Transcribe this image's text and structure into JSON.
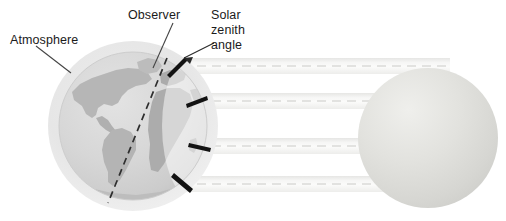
{
  "figure": {
    "kind": "solar-zenith-angle-diagram",
    "width": 506,
    "height": 221,
    "background": "#ffffff"
  },
  "labels": {
    "atmosphere": "Atmosphere",
    "observer": "Observer",
    "solar_zenith_angle_line1": "Solar",
    "solar_zenith_angle_line2": "zenith",
    "solar_zenith_angle_line3": "angle"
  },
  "colors": {
    "text": "#1b1b1b",
    "leader_line": "#3a3a3a",
    "atmosphere_halo": "#e2e2e2",
    "earth_ocean": "#d8d8d8",
    "earth_land": "#b4b4b4",
    "earth_land_dark": "#a0a0a0",
    "terminator_dash": "#2b2b2b",
    "zenith_marker": "#111111",
    "sun_body": "#dcdcdc",
    "sun_highlight": "#f2f2f0",
    "ray_band": "#f0f0ee",
    "ray_dash": "#d8d8d6"
  },
  "earth": {
    "name": "Earth",
    "center_x": 133,
    "center_y": 126,
    "globe_radius": 74,
    "atmosphere_radius": 85
  },
  "sun": {
    "name": "Sun",
    "center_x": 428,
    "center_y": 138,
    "radius": 70
  },
  "observer_line": {
    "name": "observer-meridian",
    "style": "dashed",
    "x1": 166,
    "y1": 60,
    "x2": 109,
    "y2": 202
  },
  "zenith_markers": [
    {
      "id": 1,
      "x": 178,
      "y": 66,
      "angle_deg": -52,
      "length": 22
    },
    {
      "id": 2,
      "x": 196,
      "y": 99,
      "angle_deg": -18,
      "length": 22
    },
    {
      "id": 3,
      "x": 199,
      "y": 144,
      "angle_deg": 12,
      "length": 22
    },
    {
      "id": 4,
      "x": 182,
      "y": 180,
      "angle_deg": 40,
      "length": 22
    }
  ],
  "sun_rays": [
    {
      "id": 1,
      "center_y": 66,
      "thickness": 15
    },
    {
      "id": 2,
      "center_y": 101,
      "thickness": 15
    },
    {
      "id": 3,
      "center_y": 146,
      "thickness": 15
    },
    {
      "id": 4,
      "center_y": 184,
      "thickness": 15
    }
  ],
  "leaders": {
    "atmosphere": {
      "x1": 35,
      "y1": 45,
      "x2": 70,
      "y2": 72
    },
    "observer": {
      "x1": 172,
      "y1": 22,
      "x2": 152,
      "y2": 68
    },
    "solar_zenith_angle": {
      "x1": 215,
      "y1": 42,
      "x2": 183,
      "y2": 60
    }
  }
}
